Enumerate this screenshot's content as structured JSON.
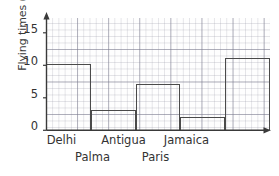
{
  "chart_data": {
    "type": "bar",
    "title": "",
    "xlabel": "",
    "ylabel": "Flying times (h)",
    "categories": [
      "Delhi",
      "Palma",
      "Antigua",
      "Paris",
      "Jamaica"
    ],
    "values": [
      10,
      3,
      7,
      2,
      11
    ],
    "unit": "h",
    "ylim": [
      0,
      17
    ],
    "yticks": [
      0,
      5,
      10,
      15
    ],
    "ytick_labels": [
      "0",
      "5",
      "10",
      "15"
    ],
    "grid": true,
    "grid_minor_step": 1,
    "grid_major_step": 5,
    "legend": "none",
    "bar_style": "outline",
    "axis_arrows": true,
    "xlabel_rows": [
      {
        "row": 0,
        "labels": [
          "Delhi",
          "Antigua",
          "Jamaica"
        ]
      },
      {
        "row": 1,
        "labels": [
          "Palma",
          "Paris"
        ]
      }
    ]
  },
  "colors": {
    "bar_outline": "#4a4a4a",
    "axis": "#3a3a3a",
    "grid_major": "#78788a",
    "grid_minor": "#9696a5",
    "text": "#333333",
    "background": "#ffffff"
  }
}
